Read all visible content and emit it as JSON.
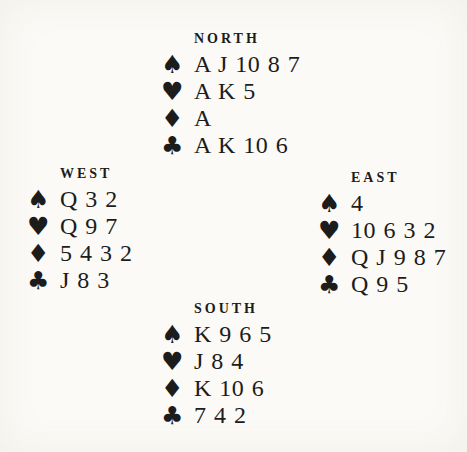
{
  "colors": {
    "paper": "#fbfaf6",
    "ink": "#1c1c1c"
  },
  "hands": {
    "north": {
      "label": "NORTH",
      "suits": [
        {
          "name": "spades",
          "symbol": "♠",
          "cards": "A J 10 8 7"
        },
        {
          "name": "hearts",
          "symbol": "♥",
          "cards": "A K 5"
        },
        {
          "name": "diamonds",
          "symbol": "♦",
          "cards": "A"
        },
        {
          "name": "clubs",
          "symbol": "♣",
          "cards": "A K 10 6"
        }
      ]
    },
    "west": {
      "label": "WEST",
      "suits": [
        {
          "name": "spades",
          "symbol": "♠",
          "cards": "Q 3 2"
        },
        {
          "name": "hearts",
          "symbol": "♥",
          "cards": "Q 9 7"
        },
        {
          "name": "diamonds",
          "symbol": "♦",
          "cards": "5 4 3 2"
        },
        {
          "name": "clubs",
          "symbol": "♣",
          "cards": "J 8 3"
        }
      ]
    },
    "east": {
      "label": "EAST",
      "suits": [
        {
          "name": "spades",
          "symbol": "♠",
          "cards": "4"
        },
        {
          "name": "hearts",
          "symbol": "♥",
          "cards": "10 6 3 2"
        },
        {
          "name": "diamonds",
          "symbol": "♦",
          "cards": "Q J 9 8 7"
        },
        {
          "name": "clubs",
          "symbol": "♣",
          "cards": "Q 9 5"
        }
      ]
    },
    "south": {
      "label": "SOUTH",
      "suits": [
        {
          "name": "spades",
          "symbol": "♠",
          "cards": "K 9 6 5"
        },
        {
          "name": "hearts",
          "symbol": "♥",
          "cards": "J 8 4"
        },
        {
          "name": "diamonds",
          "symbol": "♦",
          "cards": "K 10 6"
        },
        {
          "name": "clubs",
          "symbol": "♣",
          "cards": "7 4 2"
        }
      ]
    }
  }
}
